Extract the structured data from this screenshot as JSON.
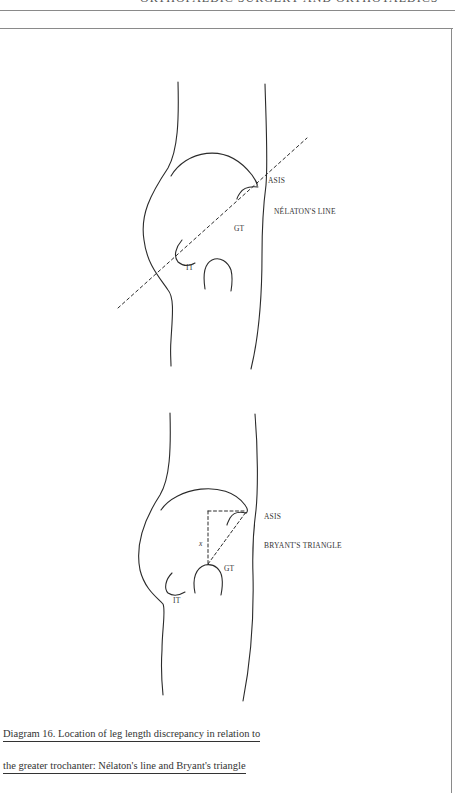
{
  "page": {
    "running_head": "ORTHOPAEDIC SURGERY AND ORTHOTAEDICS"
  },
  "figure": {
    "number": "Diagram 16",
    "caption_line1": "Diagram 16. Location of leg length discrepancy in relation to",
    "caption_line2": "the greater trochanter: Nélaton's line and Bryant's triangle",
    "panels": [
      {
        "id": "top",
        "title_label": "NÉLATON'S LINE",
        "labels": {
          "asis": "ASIS",
          "gt": "GT",
          "it": "IT"
        }
      },
      {
        "id": "bottom",
        "title_label": "BRYANT'S TRIANGLE",
        "labels": {
          "asis": "ASIS",
          "gt": "GT",
          "it": "IT",
          "x": "x"
        }
      }
    ]
  }
}
